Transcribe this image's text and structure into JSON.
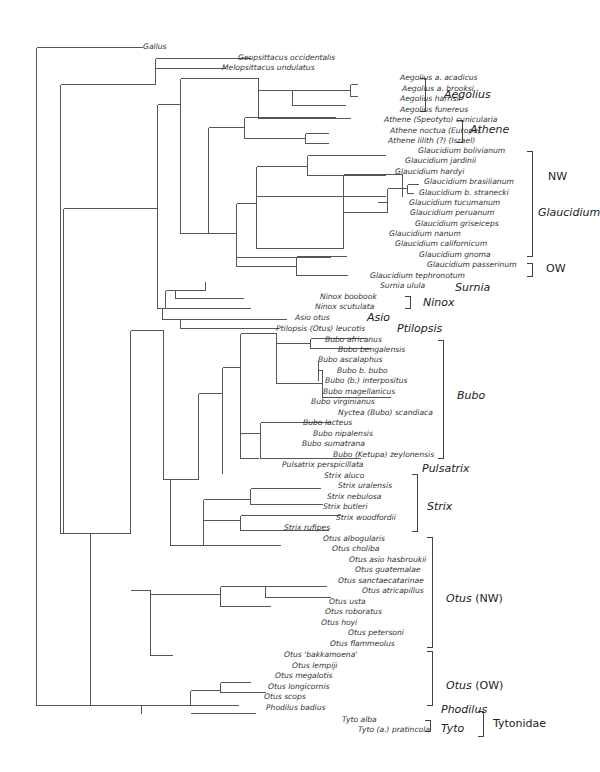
{
  "figure": {
    "type": "phylogenetic-tree",
    "width": 593,
    "height": 772,
    "line_color": "#555555",
    "text_color": "#333333"
  },
  "branches": [
    [
      36,
      47,
      36,
      705
    ],
    [
      36,
      47,
      142,
      47
    ],
    [
      36,
      705,
      94,
      705
    ],
    [
      60,
      84,
      60,
      533
    ],
    [
      60,
      84,
      60,
      84
    ],
    [
      60,
      533,
      63,
      533
    ],
    [
      155,
      58,
      155,
      68
    ],
    [
      155,
      58,
      250,
      58
    ],
    [
      155,
      68,
      225,
      68
    ],
    [
      60,
      84,
      155,
      84
    ],
    [
      155,
      84,
      155,
      63
    ],
    [
      63,
      208,
      63,
      533
    ],
    [
      63,
      208,
      157,
      208
    ],
    [
      63,
      533,
      90,
      533
    ],
    [
      157,
      104,
      157,
      308
    ],
    [
      157,
      108,
      157,
      108
    ],
    [
      157,
      308,
      165,
      308
    ],
    [
      157,
      104,
      180,
      104
    ],
    [
      180,
      78,
      180,
      233
    ],
    [
      180,
      78,
      258,
      78
    ],
    [
      258,
      78,
      258,
      118
    ],
    [
      258,
      118,
      350,
      118
    ],
    [
      258,
      90,
      292,
      90
    ],
    [
      292,
      90,
      292,
      105
    ],
    [
      292,
      90,
      350,
      90
    ],
    [
      292,
      105,
      345,
      105
    ],
    [
      350,
      84,
      350,
      96
    ],
    [
      350,
      84,
      357,
      84
    ],
    [
      350,
      96,
      357,
      96
    ],
    [
      350,
      118,
      350,
      118
    ],
    [
      180,
      233,
      208,
      233
    ],
    [
      208,
      127,
      208,
      233
    ],
    [
      208,
      127,
      244,
      127
    ],
    [
      244,
      117,
      244,
      138
    ],
    [
      244,
      117,
      335,
      117
    ],
    [
      244,
      138,
      305,
      138
    ],
    [
      305,
      133,
      305,
      143
    ],
    [
      305,
      133,
      328,
      133
    ],
    [
      305,
      143,
      328,
      143
    ],
    [
      208,
      233,
      236,
      233
    ],
    [
      236,
      203,
      236,
      266
    ],
    [
      236,
      203,
      256,
      203
    ],
    [
      256,
      166,
      256,
      248
    ],
    [
      256,
      166,
      307,
      166
    ],
    [
      307,
      155,
      307,
      175
    ],
    [
      307,
      155,
      385,
      155
    ],
    [
      307,
      175,
      385,
      175
    ],
    [
      256,
      248,
      343,
      248
    ],
    [
      343,
      174,
      343,
      248
    ],
    [
      343,
      174,
      402,
      174
    ],
    [
      402,
      174,
      402,
      196
    ],
    [
      402,
      174,
      402,
      174
    ],
    [
      343,
      174,
      373,
      174
    ],
    [
      373,
      196,
      373,
      196
    ],
    [
      256,
      196,
      385,
      196
    ],
    [
      343,
      212,
      387,
      212
    ],
    [
      387,
      188,
      387,
      212
    ],
    [
      387,
      188,
      407,
      188
    ],
    [
      407,
      184,
      407,
      193
    ],
    [
      407,
      184,
      418,
      184
    ],
    [
      407,
      193,
      413,
      193
    ],
    [
      387,
      202,
      377,
      202
    ],
    [
      387,
      212,
      382,
      212
    ],
    [
      236,
      266,
      296,
      266
    ],
    [
      296,
      256,
      296,
      275
    ],
    [
      296,
      256,
      346,
      256
    ],
    [
      296,
      275,
      347,
      275
    ],
    [
      236,
      257,
      330,
      257
    ],
    [
      165,
      290,
      165,
      308
    ],
    [
      165,
      290,
      175,
      290
    ],
    [
      175,
      290,
      175,
      298
    ],
    [
      175,
      298,
      243,
      298
    ],
    [
      175,
      290,
      205,
      290
    ],
    [
      205,
      281,
      205,
      290
    ],
    [
      165,
      308,
      250,
      308
    ],
    [
      157,
      308,
      162,
      308
    ],
    [
      162,
      308,
      162,
      319
    ],
    [
      162,
      319,
      180,
      319
    ],
    [
      180,
      319,
      180,
      328
    ],
    [
      180,
      319,
      286,
      319
    ],
    [
      180,
      328,
      278,
      328
    ],
    [
      162,
      330,
      130,
      330
    ],
    [
      130,
      330,
      130,
      533
    ],
    [
      130,
      330,
      163,
      330
    ],
    [
      163,
      330,
      163,
      479
    ],
    [
      163,
      479,
      198,
      479
    ],
    [
      198,
      393,
      198,
      479
    ],
    [
      198,
      393,
      222,
      393
    ],
    [
      222,
      367,
      222,
      433
    ],
    [
      222,
      367,
      240,
      367
    ],
    [
      240,
      333,
      240,
      458
    ],
    [
      240,
      333,
      276,
      333
    ],
    [
      276,
      333,
      276,
      383
    ],
    [
      276,
      343,
      310,
      343
    ],
    [
      310,
      338,
      310,
      348
    ],
    [
      310,
      338,
      365,
      338
    ],
    [
      310,
      348,
      370,
      348
    ],
    [
      276,
      383,
      322,
      383
    ],
    [
      322,
      370,
      322,
      397
    ],
    [
      322,
      370,
      318,
      370
    ],
    [
      318,
      360,
      318,
      370
    ],
    [
      318,
      360,
      318,
      380
    ],
    [
      322,
      397,
      390,
      397
    ],
    [
      240,
      433,
      260,
      433
    ],
    [
      260,
      422,
      260,
      458
    ],
    [
      260,
      422,
      330,
      422
    ],
    [
      260,
      458,
      360,
      458
    ],
    [
      240,
      458,
      258,
      458
    ],
    [
      222,
      433,
      222,
      473
    ],
    [
      198,
      479,
      195,
      479
    ],
    [
      130,
      533,
      122,
      533
    ],
    [
      122,
      533,
      122,
      533
    ],
    [
      163,
      479,
      170,
      479
    ],
    [
      170,
      479,
      170,
      545
    ],
    [
      170,
      545,
      203,
      545
    ],
    [
      203,
      499,
      203,
      545
    ],
    [
      203,
      499,
      250,
      499
    ],
    [
      250,
      488,
      250,
      504
    ],
    [
      250,
      488,
      320,
      488
    ],
    [
      250,
      504,
      322,
      504
    ],
    [
      203,
      520,
      240,
      520
    ],
    [
      240,
      515,
      240,
      530
    ],
    [
      240,
      515,
      340,
      515
    ],
    [
      240,
      530,
      328,
      530
    ],
    [
      203,
      545,
      280,
      545
    ],
    [
      90,
      533,
      90,
      705
    ],
    [
      90,
      533,
      130,
      533
    ],
    [
      130,
      590,
      150,
      590
    ],
    [
      150,
      590,
      150,
      655
    ],
    [
      150,
      594,
      220,
      594
    ],
    [
      220,
      586,
      220,
      606
    ],
    [
      220,
      586,
      265,
      586
    ],
    [
      265,
      586,
      265,
      597
    ],
    [
      265,
      586,
      326,
      586
    ],
    [
      265,
      597,
      330,
      597
    ],
    [
      220,
      606,
      270,
      606
    ],
    [
      150,
      655,
      172,
      655
    ],
    [
      94,
      705,
      141,
      705
    ],
    [
      141,
      705,
      141,
      713
    ],
    [
      141,
      705,
      190,
      705
    ],
    [
      190,
      690,
      190,
      705
    ],
    [
      190,
      690,
      220,
      690
    ],
    [
      220,
      682,
      220,
      692
    ],
    [
      220,
      682,
      250,
      682
    ],
    [
      220,
      692,
      265,
      692
    ],
    [
      190,
      705,
      238,
      705
    ],
    [
      190,
      713,
      255,
      713
    ]
  ],
  "taxa": [
    {
      "label": "Gallus",
      "x": 143,
      "y": 47
    },
    {
      "label": "Geopsittacus occidentalis",
      "x": 238,
      "y": 58
    },
    {
      "label": "Melopsittacus undulatus",
      "x": 222,
      "y": 68
    },
    {
      "label": "Aegolius a. acadicus",
      "x": 400,
      "y": 78
    },
    {
      "label": "Aegolius a. brooksi",
      "x": 402,
      "y": 89
    },
    {
      "label": "Aegolius harrisii",
      "x": 400,
      "y": 99
    },
    {
      "label": "Aegolius funereus",
      "x": 400,
      "y": 110
    },
    {
      "label": "Athene (Speotyto) cunicularia",
      "x": 384,
      "y": 120
    },
    {
      "label": "Athene noctua (Europe)",
      "x": 390,
      "y": 131
    },
    {
      "label": "Athene lilith (?) (Israel)",
      "x": 388,
      "y": 141
    },
    {
      "label": "Glaucidium bolivianum",
      "x": 418,
      "y": 151
    },
    {
      "label": "Glaucidium jardinii",
      "x": 405,
      "y": 161
    },
    {
      "label": "Glaucidium hardyi",
      "x": 395,
      "y": 172
    },
    {
      "label": "Glaucidium brasilianum",
      "x": 424,
      "y": 182
    },
    {
      "label": "Glaucidium b. stranecki",
      "x": 419,
      "y": 193
    },
    {
      "label": "Glaucidium tucumanum",
      "x": 409,
      "y": 203
    },
    {
      "label": "Glaucidium peruanum",
      "x": 410,
      "y": 213
    },
    {
      "label": "Glaucidium griseiceps",
      "x": 415,
      "y": 224
    },
    {
      "label": "Glaucidium nanum",
      "x": 389,
      "y": 234
    },
    {
      "label": "Glaucidium californicum",
      "x": 395,
      "y": 244
    },
    {
      "label": "Glaucidium gnoma",
      "x": 419,
      "y": 255
    },
    {
      "label": "Glaucidium passerinum",
      "x": 427,
      "y": 265
    },
    {
      "label": "Glaucidium tephronotum",
      "x": 370,
      "y": 276
    },
    {
      "label": "Surnia ulula",
      "x": 380,
      "y": 286
    },
    {
      "label": "Ninox boobook",
      "x": 320,
      "y": 297
    },
    {
      "label": "Ninox scutulata",
      "x": 315,
      "y": 307
    },
    {
      "label": "Asio otus",
      "x": 295,
      "y": 318
    },
    {
      "label": "Ptilopsis (Otus) leucotis",
      "x": 276,
      "y": 329
    },
    {
      "label": "Bubo africanus",
      "x": 325,
      "y": 340
    },
    {
      "label": "Bubo bengalensis",
      "x": 338,
      "y": 350
    },
    {
      "label": "Bubo ascalaphus",
      "x": 318,
      "y": 360
    },
    {
      "label": "Bubo b. bubo",
      "x": 337,
      "y": 371
    },
    {
      "label": "Bubo (b.) interpositus",
      "x": 325,
      "y": 381
    },
    {
      "label": "Bubo magellanicus",
      "x": 323,
      "y": 392
    },
    {
      "label": "Bubo virginianus",
      "x": 311,
      "y": 402
    },
    {
      "label": "Nyctea (Bubo) scandiaca",
      "x": 338,
      "y": 413
    },
    {
      "label": "Bubo lacteus",
      "x": 303,
      "y": 423
    },
    {
      "label": "Bubo nipalensis",
      "x": 313,
      "y": 434
    },
    {
      "label": "Bubo sumatrana",
      "x": 302,
      "y": 444
    },
    {
      "label": "Bubo (Ketupa) zeylonensis",
      "x": 333,
      "y": 455
    },
    {
      "label": "Pulsatrix perspicillata",
      "x": 282,
      "y": 465
    },
    {
      "label": "Strix aluco",
      "x": 324,
      "y": 476
    },
    {
      "label": "Strix uralensis",
      "x": 338,
      "y": 486
    },
    {
      "label": "Strix nebulosa",
      "x": 327,
      "y": 497
    },
    {
      "label": "Strix butleri",
      "x": 323,
      "y": 507
    },
    {
      "label": "Strix woodfordii",
      "x": 336,
      "y": 518
    },
    {
      "label": "Strix rufipes",
      "x": 284,
      "y": 528
    },
    {
      "label": "Otus albogularis",
      "x": 323,
      "y": 539
    },
    {
      "label": "Otus choliba",
      "x": 332,
      "y": 549
    },
    {
      "label": "Otus asio hasbroukii",
      "x": 349,
      "y": 560
    },
    {
      "label": "Otus guatemalae",
      "x": 355,
      "y": 570
    },
    {
      "label": "Otus sanctaecatarinae",
      "x": 338,
      "y": 581
    },
    {
      "label": "Otus atricapillus",
      "x": 362,
      "y": 591
    },
    {
      "label": "Otus usta",
      "x": 329,
      "y": 602
    },
    {
      "label": "Otus roboratus",
      "x": 325,
      "y": 612
    },
    {
      "label": "Otus hoyi",
      "x": 321,
      "y": 623
    },
    {
      "label": "Otus petersoni",
      "x": 348,
      "y": 633
    },
    {
      "label": "Otus flammeolus",
      "x": 330,
      "y": 644
    },
    {
      "label": "Otus 'bakkamoena'",
      "x": 284,
      "y": 655
    },
    {
      "label": "Otus lempiji",
      "x": 292,
      "y": 666
    },
    {
      "label": "Otus megalotis",
      "x": 275,
      "y": 676
    },
    {
      "label": "Otus longicornis",
      "x": 268,
      "y": 687
    },
    {
      "label": "Otus scops",
      "x": 264,
      "y": 697
    },
    {
      "label": "Phodilus badius",
      "x": 266,
      "y": 708
    },
    {
      "label": "Tyto alba",
      "x": 342,
      "y": 720
    },
    {
      "label": "Tyto (a.) pratincola",
      "x": 358,
      "y": 730
    }
  ],
  "brackets": [
    {
      "name": "aegolius",
      "x": 425,
      "y1": 78,
      "y2": 111,
      "tick": 6
    },
    {
      "name": "athene",
      "x": 462,
      "y1": 120,
      "y2": 142,
      "tick": 6
    },
    {
      "name": "glaucidium-nw",
      "x": 532,
      "y1": 151,
      "y2": 256,
      "tick": 6
    },
    {
      "name": "glaucidium-ow",
      "x": 532,
      "y1": 263,
      "y2": 276,
      "tick": 6
    },
    {
      "name": "ninox",
      "x": 410,
      "y1": 296,
      "y2": 308,
      "tick": 6
    },
    {
      "name": "bubo",
      "x": 443,
      "y1": 340,
      "y2": 458,
      "tick": 6
    },
    {
      "name": "strix",
      "x": 417,
      "y1": 474,
      "y2": 531,
      "tick": 6
    },
    {
      "name": "otus-nw",
      "x": 432,
      "y1": 537,
      "y2": 647,
      "tick": 6
    },
    {
      "name": "otus-ow",
      "x": 432,
      "y1": 651,
      "y2": 705,
      "tick": 6
    },
    {
      "name": "tyto",
      "x": 430,
      "y1": 720,
      "y2": 731,
      "tick": 6
    },
    {
      "name": "tytonidae",
      "x": 483,
      "y1": 711,
      "y2": 736,
      "tick": 6
    }
  ],
  "clades": [
    {
      "name": "aegolius",
      "label": "Aegolius",
      "suffix": "",
      "x": 444,
      "y": 95,
      "italic": true
    },
    {
      "name": "athene",
      "label": "Athene",
      "suffix": "",
      "x": 470,
      "y": 130,
      "italic": true
    },
    {
      "name": "nw",
      "label": "NW",
      "suffix": "",
      "x": 548,
      "y": 177,
      "italic": false
    },
    {
      "name": "glaucidium",
      "label": "Glaucidium",
      "suffix": "",
      "x": 538,
      "y": 213,
      "italic": true
    },
    {
      "name": "ow",
      "label": "OW",
      "suffix": "",
      "x": 546,
      "y": 269,
      "italic": false
    },
    {
      "name": "surnia",
      "label": "Surnia",
      "suffix": "",
      "x": 455,
      "y": 288,
      "italic": true
    },
    {
      "name": "ninox",
      "label": "Ninox",
      "suffix": "",
      "x": 423,
      "y": 303,
      "italic": true
    },
    {
      "name": "asio",
      "label": "Asio",
      "suffix": "",
      "x": 367,
      "y": 318,
      "italic": true
    },
    {
      "name": "ptilopsis",
      "label": "Ptilopsis",
      "suffix": "",
      "x": 397,
      "y": 329,
      "italic": true
    },
    {
      "name": "bubo",
      "label": "Bubo",
      "suffix": "",
      "x": 457,
      "y": 396,
      "italic": true
    },
    {
      "name": "pulsatrix",
      "label": "Pulsatrix",
      "suffix": "",
      "x": 422,
      "y": 469,
      "italic": true
    },
    {
      "name": "strix",
      "label": "Strix",
      "suffix": "",
      "x": 427,
      "y": 507,
      "italic": true
    },
    {
      "name": "otus-nw",
      "label": "Otus",
      "suffix": " (NW)",
      "x": 446,
      "y": 599,
      "italic": true
    },
    {
      "name": "otus-ow",
      "label": "Otus",
      "suffix": " (OW)",
      "x": 446,
      "y": 686,
      "italic": true
    },
    {
      "name": "phodilus",
      "label": "Phodilus",
      "suffix": "",
      "x": 441,
      "y": 710,
      "italic": true
    },
    {
      "name": "tyto",
      "label": "Tyto",
      "suffix": "",
      "x": 441,
      "y": 729,
      "italic": true
    },
    {
      "name": "tytonidae",
      "label": "Tytonidae",
      "suffix": "",
      "x": 493,
      "y": 724,
      "italic": false
    }
  ]
}
